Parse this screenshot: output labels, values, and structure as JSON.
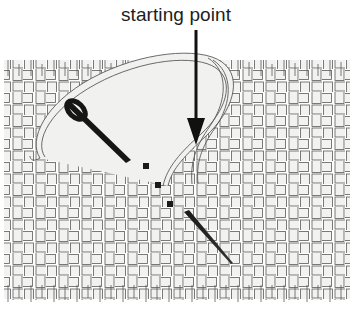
{
  "figure": {
    "title": "starting point",
    "width": 352,
    "height": 322,
    "background_color": "#ffffff"
  },
  "caption": {
    "text": "starting point",
    "color": "#1d1d1d",
    "font_size_px": 19,
    "align": "center",
    "top_px": 3
  },
  "annotations": {
    "arrow": {
      "name": "starting-point-arrow",
      "label": "starting point",
      "color": "#111111",
      "x": 196,
      "y_start": 30,
      "y_tip": 142,
      "shaft_width_px": 3,
      "head_width_px": 17,
      "head_height_px": 22,
      "direction": "down"
    }
  },
  "fabric": {
    "name": "woven-fabric",
    "weave_type": "plain weave",
    "cell_size_px": 23,
    "columns": 15,
    "rows": 10,
    "left_px": 4,
    "top_px": 60,
    "right_px": 350,
    "bottom_px": 300,
    "thread_fill": "#f2f2f0",
    "thread_stroke": "#4a4a4a",
    "stroke_width_px": 0.8,
    "fringe_top": true,
    "fringe_bottom": true,
    "fringe_length_px": 16
  },
  "needle": {
    "name": "embroidery-needle",
    "color": "#161616",
    "description": "dark needle with eye, angled down-right",
    "x1": 63,
    "y1": 98,
    "x2": 128,
    "y2": 158,
    "eye_center_x": 76,
    "eye_center_y": 110,
    "eye_radius_px": 9
  },
  "thread": {
    "name": "thread-loop",
    "fill": "#efefed",
    "stroke": "#5a5a5a",
    "width_px": 5,
    "description": "light looping thread passing through needle eye and down to starting point"
  },
  "stitches": {
    "name": "stitch-marks",
    "color": "#1a1a1a",
    "description": "small dark squares along a diagonal running down-right",
    "size_px": 6,
    "points": [
      {
        "x": 146,
        "y": 166
      },
      {
        "x": 158,
        "y": 185
      },
      {
        "x": 170,
        "y": 204
      }
    ]
  },
  "tail_stitch": {
    "name": "tail-thread",
    "color": "#262626",
    "x1": 186,
    "y1": 214,
    "x2": 232,
    "y2": 262,
    "width_start_px": 5,
    "width_end_px": 1
  }
}
